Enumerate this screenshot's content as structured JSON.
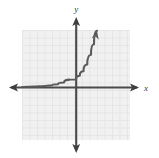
{
  "figure": {
    "width": 159,
    "height": 158,
    "background_color": "#ffffff",
    "title": ""
  },
  "axes": {
    "x_label": "x",
    "y_label": "y",
    "axis_color": "#4a4a4a",
    "origin": {
      "x": 76,
      "y": 87
    },
    "x_axis": {
      "start_x": 10,
      "end_x": 139,
      "y": 87,
      "arrow_left": true,
      "arrow_right": true
    },
    "y_axis": {
      "x": 76,
      "start_y": 18,
      "end_y": 152,
      "arrow_up": true,
      "arrow_down": true
    }
  },
  "grid": {
    "left": 22,
    "top": 30,
    "right": 130,
    "bottom": 140,
    "cell_size": 7.5,
    "line_color": "#dcdcdc",
    "fill_color": "#f0f0f0",
    "visible": true
  },
  "chart_data": {
    "type": "line",
    "title": "",
    "xlabel": "x",
    "ylabel": "y",
    "grid": true,
    "legend": "none",
    "xlim": [
      -7.2,
      7.2
    ],
    "ylim": [
      -7.1,
      7.6
    ],
    "curve_color": "#5a5a5a",
    "series": [
      {
        "name": "exponential",
        "description": "increasing exponential curve with horizontal asymptote y=0, passing just above the origin and rising steeply to the upper right",
        "arrow_end": true,
        "x": [
          -7.2,
          -6.4,
          -5.6,
          -4.8,
          -4.0,
          -3.2,
          -2.4,
          -1.6,
          -0.8,
          0.0,
          0.5,
          1.0,
          1.5,
          2.0,
          2.4,
          2.8
        ],
        "y": [
          0.02,
          0.03,
          0.05,
          0.08,
          0.13,
          0.22,
          0.36,
          0.6,
          0.99,
          1.0,
          1.5,
          2.1,
          3.0,
          4.3,
          5.7,
          7.5
        ]
      }
    ]
  }
}
